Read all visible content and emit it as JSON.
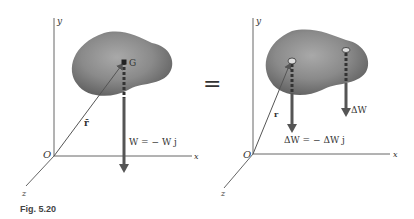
{
  "figure": {
    "caption": "Fig. 5.20",
    "equals_sign": "="
  },
  "left_panel": {
    "axes": {
      "x": "x",
      "y": "y",
      "z": "z",
      "origin": "O"
    },
    "center_of_gravity_label": "G",
    "position_vector_label": "r̄",
    "weight_label": "W = − W j"
  },
  "right_panel": {
    "axes": {
      "x": "x",
      "y": "y",
      "z": "z",
      "origin": "O"
    },
    "position_vector_label": "r",
    "element_weight_label": "ΔW",
    "element_weight_eq_label": "ΔW = − ΔW j"
  },
  "colors": {
    "body_fill": "#7d7d7d",
    "body_highlight": "#a8a8a8",
    "axis": "#666666",
    "vector": "#555555",
    "background": "#ffffff"
  }
}
